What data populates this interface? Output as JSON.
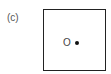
{
  "panel": {
    "label": "(c)"
  },
  "diagram": {
    "frame": "square",
    "point_label": "O",
    "point": "dot"
  }
}
